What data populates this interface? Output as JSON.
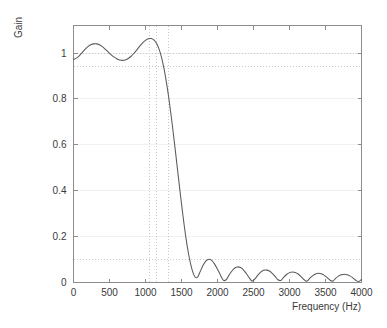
{
  "figure": {
    "background": "#ffffff",
    "width": 387,
    "height": 328,
    "axis_color": "#8c8c8c",
    "curve_color": "#5a5a5a",
    "spec_line_color": "#c9c9c9",
    "grid_color": "#f1f1f1"
  },
  "chart_data": {
    "type": "line",
    "title": "",
    "xlabel": "Frequency (Hz)",
    "ylabel": "Gain",
    "xlim": [
      0,
      4000
    ],
    "ylim": [
      0,
      1.12
    ],
    "grid": false,
    "legend": null,
    "xticks": [
      0,
      500,
      1000,
      1500,
      2000,
      2500,
      3000,
      3500,
      4000
    ],
    "xticklabels": [
      "0",
      "500",
      "1000",
      "1500",
      "2000",
      "2500",
      "3000",
      "3500",
      "4000"
    ],
    "yticks": [
      0,
      0.2,
      0.4,
      0.6,
      0.8,
      1
    ],
    "yticklabels": [
      "0",
      "0.2",
      "0.4",
      "0.6",
      "0.8",
      "1"
    ],
    "spec_lines": {
      "horizontal": [
        {
          "value": 1.0,
          "label": "unity gain"
        },
        {
          "value": 0.94,
          "label": "passband lower ripple bound"
        },
        {
          "value": 0.1,
          "label": "stopband attenuation bound"
        }
      ],
      "vertical": [
        {
          "value": 1060,
          "label": "passband edge"
        },
        {
          "value": 1150,
          "label": "transition marker"
        },
        {
          "value": 1320,
          "label": "stopband edge"
        }
      ]
    },
    "series": [
      {
        "name": "Gain",
        "x": [
          0,
          40,
          80,
          120,
          160,
          200,
          240,
          280,
          320,
          360,
          400,
          440,
          480,
          520,
          560,
          600,
          640,
          680,
          720,
          760,
          800,
          840,
          880,
          920,
          960,
          1000,
          1040,
          1080,
          1120,
          1160,
          1200,
          1240,
          1280,
          1320,
          1360,
          1400,
          1440,
          1480,
          1520,
          1560,
          1600,
          1640,
          1680,
          1720,
          1760,
          1800,
          1840,
          1880,
          1920,
          1960,
          2000,
          2040,
          2080,
          2120,
          2160,
          2200,
          2240,
          2280,
          2320,
          2360,
          2400,
          2440,
          2480,
          2520,
          2560,
          2600,
          2640,
          2680,
          2720,
          2760,
          2800,
          2840,
          2880,
          2920,
          2960,
          3000,
          3040,
          3080,
          3120,
          3160,
          3200,
          3240,
          3280,
          3320,
          3360,
          3400,
          3440,
          3480,
          3520,
          3560,
          3600,
          3640,
          3680,
          3720,
          3760,
          3800,
          3840,
          3880,
          3920,
          3960,
          4000
        ],
        "y": [
          0.972,
          0.978,
          0.988,
          1.002,
          1.016,
          1.028,
          1.036,
          1.04,
          1.04,
          1.036,
          1.028,
          1.017,
          1.005,
          0.993,
          0.983,
          0.975,
          0.97,
          0.968,
          0.97,
          0.976,
          0.986,
          0.999,
          1.014,
          1.03,
          1.044,
          1.055,
          1.062,
          1.063,
          1.056,
          1.038,
          1.006,
          0.958,
          0.893,
          0.812,
          0.718,
          0.614,
          0.505,
          0.396,
          0.292,
          0.198,
          0.121,
          0.064,
          0.028,
          0.022,
          0.048,
          0.075,
          0.094,
          0.101,
          0.096,
          0.08,
          0.058,
          0.033,
          0.01,
          0.012,
          0.032,
          0.05,
          0.063,
          0.068,
          0.065,
          0.055,
          0.039,
          0.021,
          0.006,
          0.016,
          0.032,
          0.045,
          0.053,
          0.054,
          0.05,
          0.04,
          0.027,
          0.012,
          0.009,
          0.023,
          0.035,
          0.043,
          0.046,
          0.044,
          0.037,
          0.026,
          0.013,
          0.005,
          0.018,
          0.029,
          0.037,
          0.04,
          0.038,
          0.032,
          0.022,
          0.011,
          0.006,
          0.018,
          0.028,
          0.034,
          0.036,
          0.034,
          0.029,
          0.02,
          0.01,
          0.004,
          0.014
        ]
      }
    ]
  }
}
